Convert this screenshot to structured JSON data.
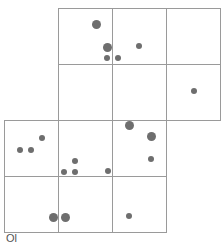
{
  "diagram": {
    "type": "grid-net-with-dots",
    "cell_size": {
      "w": 55,
      "h": 56
    },
    "cells": [
      {
        "col": 1,
        "row": 0
      },
      {
        "col": 2,
        "row": 0
      },
      {
        "col": 3,
        "row": 0
      },
      {
        "col": 1,
        "row": 1
      },
      {
        "col": 2,
        "row": 1
      },
      {
        "col": 3,
        "row": 1
      },
      {
        "col": 0,
        "row": 2
      },
      {
        "col": 1,
        "row": 2
      },
      {
        "col": 2,
        "row": 2
      },
      {
        "col": 0,
        "row": 3
      },
      {
        "col": 1,
        "row": 3
      },
      {
        "col": 2,
        "row": 3
      }
    ],
    "dots": [
      {
        "x": 96,
        "y": 24,
        "size": "large"
      },
      {
        "x": 107,
        "y": 47,
        "size": "large"
      },
      {
        "x": 107,
        "y": 58,
        "size": "small"
      },
      {
        "x": 118,
        "y": 58,
        "size": "small"
      },
      {
        "x": 139,
        "y": 46,
        "size": "small"
      },
      {
        "x": 194,
        "y": 91,
        "size": "small"
      },
      {
        "x": 129,
        "y": 125,
        "size": "large"
      },
      {
        "x": 151,
        "y": 136,
        "size": "large"
      },
      {
        "x": 151,
        "y": 159,
        "size": "small"
      },
      {
        "x": 42,
        "y": 138,
        "size": "small"
      },
      {
        "x": 20,
        "y": 150,
        "size": "small"
      },
      {
        "x": 31,
        "y": 150,
        "size": "small"
      },
      {
        "x": 75,
        "y": 161,
        "size": "small"
      },
      {
        "x": 64,
        "y": 172,
        "size": "small"
      },
      {
        "x": 75,
        "y": 172,
        "size": "small"
      },
      {
        "x": 108,
        "y": 171,
        "size": "small"
      },
      {
        "x": 53,
        "y": 217,
        "size": "large"
      },
      {
        "x": 65,
        "y": 217,
        "size": "large"
      },
      {
        "x": 129,
        "y": 216,
        "size": "small"
      }
    ],
    "colors": {
      "line": "#9a9a9a",
      "dot": "#6e6e6e",
      "background": "#ffffff"
    },
    "caption": "Ol"
  }
}
